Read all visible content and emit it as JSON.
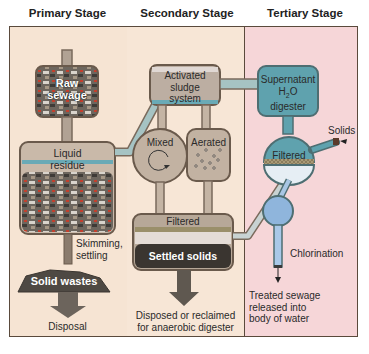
{
  "stages": {
    "primary": "Primary Stage",
    "secondary": "Secondary Stage",
    "tertiary": "Tertiary Stage"
  },
  "colors": {
    "primary_bg": "#f6e4d3",
    "secondary_bg": "#f6e4d3",
    "tertiary_bg": "#f6d6d6",
    "pipe": "#8b7d6e",
    "pipe_fill": "#a4c2c4",
    "tank_tan": "#b9a89a",
    "water_blue": "#62a6b2",
    "chlor_blue": "#8fb5dc",
    "dark_solids": "#3a3530"
  },
  "primary": {
    "raw_sewage": "Raw sewage",
    "raw_line1": "Raw",
    "raw_line2": "sewage",
    "liquid_line1": "Liquid",
    "liquid_line2": "residue",
    "skim_line1": "Skimming,",
    "skim_line2": "settling",
    "solid_wastes": "Solid wastes",
    "disposal": "Disposal"
  },
  "secondary": {
    "activated_line1": "Activated",
    "activated_line2": "sludge",
    "activated_line3": "system",
    "mixed": "Mixed",
    "aerated": "Aerated",
    "filtered": "Filtered",
    "settled_solids": "Settled solids",
    "disposed_line1": "Disposed or reclaimed",
    "disposed_line2": "for anaerobic digester"
  },
  "tertiary": {
    "super_line1": "Supernatant",
    "super_line2a": "H",
    "super_line2sub": "2",
    "super_line2b": "O",
    "super_line3": "digester",
    "solids": "Solids",
    "filtered": "Filtered",
    "chlorination": "Chlorination",
    "treated_line1": "Treated sewage",
    "treated_line2": "released into",
    "treated_line3": "body of water"
  }
}
